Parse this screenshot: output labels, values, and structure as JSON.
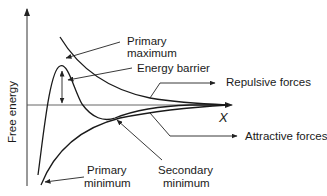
{
  "diagram": {
    "y_axis_label": "Free energy",
    "x_axis_label": "X",
    "curves": [
      {
        "name": "repulsive-forces",
        "label": "Repulsive forces"
      },
      {
        "name": "attractive-forces",
        "label": "Attractive forces"
      },
      {
        "name": "net-energy",
        "label": ""
      }
    ],
    "annotations": {
      "primary_maximum": [
        "Primary",
        "maximum"
      ],
      "energy_barrier": "Energy barrier",
      "repulsive_forces": "Repulsive forces",
      "attractive_forces": "Attractive forces",
      "primary_minimum": [
        "Primary",
        "minimum"
      ],
      "secondary_minimum": [
        "Secondary",
        "minimum"
      ]
    },
    "colors": {
      "line": "#1a1a1a",
      "background": "#ffffff"
    }
  }
}
